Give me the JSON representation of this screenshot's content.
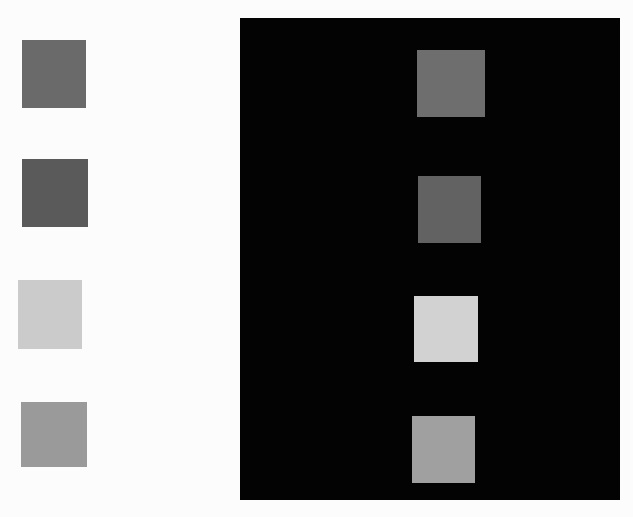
{
  "figure": {
    "left_background": "#fcfcfc",
    "right_background": "#030303",
    "left_squares": [
      {
        "x": 22,
        "y": 40,
        "w": 64,
        "h": 68,
        "color": "#6a6a6a"
      },
      {
        "x": 22,
        "y": 159,
        "w": 66,
        "h": 68,
        "color": "#5a5a5a"
      },
      {
        "x": 18,
        "y": 280,
        "w": 64,
        "h": 69,
        "color": "#cbcbcb"
      },
      {
        "x": 21,
        "y": 402,
        "w": 66,
        "h": 65,
        "color": "#9a9a9a"
      }
    ],
    "right_squares": [
      {
        "x": 417,
        "y": 50,
        "w": 68,
        "h": 67,
        "color": "#6e6e6e"
      },
      {
        "x": 418,
        "y": 176,
        "w": 63,
        "h": 67,
        "color": "#626262"
      },
      {
        "x": 414,
        "y": 296,
        "w": 64,
        "h": 66,
        "color": "#d2d2d2"
      },
      {
        "x": 412,
        "y": 416,
        "w": 63,
        "h": 67,
        "color": "#a0a0a0"
      }
    ]
  }
}
